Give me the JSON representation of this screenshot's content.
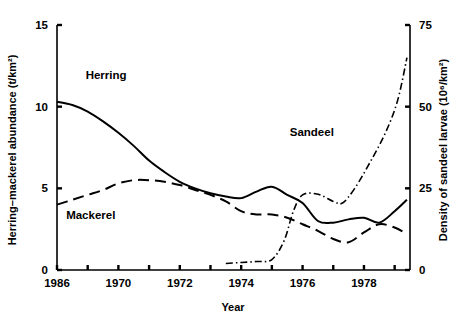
{
  "chart_data": {
    "type": "line",
    "title": "",
    "xlabel": "Year",
    "ylabel_left": "Herring–mackerel abundance (t/km²)",
    "ylabel_right": "Density of sandeel larvae (10⁶/km²)",
    "xlim": [
      1968,
      1979.5
    ],
    "ylim_left": [
      0,
      15
    ],
    "ylim_right": [
      0,
      75
    ],
    "x_ticks": [
      1968,
      1969,
      1970,
      1971,
      1972,
      1973,
      1974,
      1975,
      1976,
      1977,
      1978,
      1979
    ],
    "x_tick_labels": [
      "1986",
      "",
      "1970",
      "",
      "1972",
      "",
      "1974",
      "",
      "1976",
      "",
      "1978",
      ""
    ],
    "y_ticks_left": [
      0,
      5,
      10,
      15
    ],
    "y_tick_labels_left": [
      "0",
      "5",
      "10",
      "15"
    ],
    "y_ticks_right": [
      0,
      25,
      50,
      75
    ],
    "y_tick_labels_right": [
      "0",
      "25",
      "50",
      "75"
    ],
    "grid": false,
    "legend_position": "inline-annotations",
    "series": [
      {
        "name": "Herring",
        "axis": "left",
        "linestyle": "solid",
        "color": "#000000",
        "label_position": {
          "x": 1969.6,
          "y": 11.7
        },
        "x": [
          1968.0,
          1968.5,
          1969.0,
          1969.5,
          1970.0,
          1970.5,
          1971.0,
          1971.5,
          1972.0,
          1972.5,
          1973.0,
          1973.5,
          1974.0,
          1974.5,
          1975.0,
          1975.5,
          1976.0,
          1976.5,
          1977.0,
          1977.5,
          1978.0,
          1978.5,
          1979.0,
          1979.4
        ],
        "y": [
          10.3,
          10.1,
          9.7,
          9.1,
          8.4,
          7.6,
          6.7,
          6.0,
          5.4,
          5.0,
          4.7,
          4.5,
          4.4,
          4.8,
          5.1,
          4.6,
          4.1,
          3.0,
          2.9,
          3.1,
          3.2,
          2.9,
          3.6,
          4.3
        ]
      },
      {
        "name": "Mackerel",
        "axis": "left",
        "linestyle": "dashed",
        "color": "#000000",
        "label_position": {
          "x": 1969.1,
          "y": 3.1
        },
        "x": [
          1968.0,
          1968.5,
          1969.0,
          1969.5,
          1970.0,
          1970.5,
          1971.0,
          1971.5,
          1972.0,
          1972.5,
          1973.0,
          1973.5,
          1974.0,
          1974.5,
          1975.0,
          1975.5,
          1976.0,
          1976.5,
          1977.0,
          1977.5,
          1978.0,
          1978.5,
          1979.0,
          1979.4
        ],
        "y": [
          4.0,
          4.3,
          4.6,
          4.9,
          5.3,
          5.5,
          5.5,
          5.4,
          5.2,
          4.9,
          4.6,
          4.2,
          3.6,
          3.4,
          3.4,
          3.2,
          2.8,
          2.4,
          1.9,
          1.7,
          2.3,
          2.8,
          2.6,
          2.2
        ]
      },
      {
        "name": "Sandeel",
        "axis": "right",
        "linestyle": "dash-dot",
        "color": "#000000",
        "label_position": {
          "x": 1976.3,
          "y": 41.0
        },
        "x": [
          1973.5,
          1974.0,
          1974.5,
          1975.0,
          1975.4,
          1975.7,
          1976.0,
          1976.5,
          1977.0,
          1977.3,
          1977.7,
          1978.2,
          1978.7,
          1979.1,
          1979.4
        ],
        "y": [
          2.0,
          2.3,
          2.6,
          3.2,
          9.0,
          18.0,
          23.0,
          23.2,
          21.0,
          20.5,
          25.0,
          33.0,
          42.0,
          52.0,
          65.0
        ]
      }
    ]
  }
}
